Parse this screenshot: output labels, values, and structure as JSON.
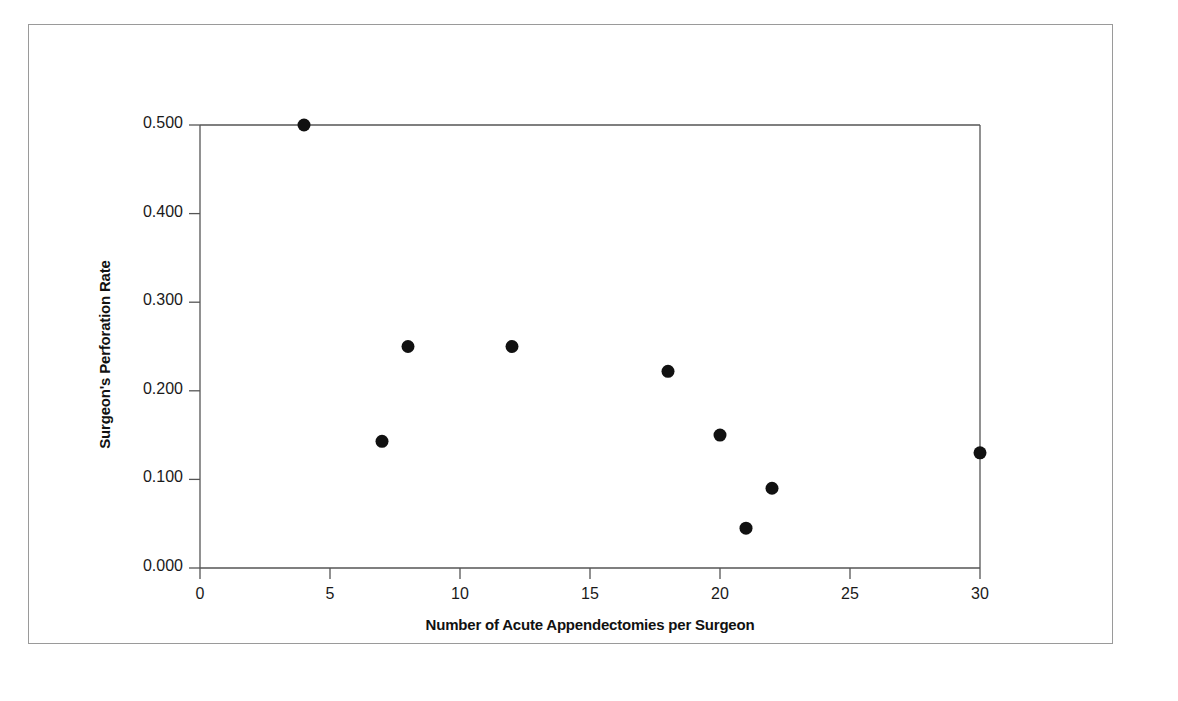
{
  "figure": {
    "background_color": "#ffffff",
    "frame_color": "#9a9a9a",
    "axis_color": "#555555",
    "marker_color": "#111111"
  },
  "chart_data": {
    "type": "scatter",
    "title": "",
    "xlabel": "Number of Acute Appendectomies per Surgeon",
    "ylabel": "Surgeon's Perforation Rate",
    "xlim": [
      0,
      30
    ],
    "ylim": [
      0.0,
      0.5
    ],
    "xticks": [
      0,
      5,
      10,
      15,
      20,
      25,
      30
    ],
    "xtick_labels": [
      "0",
      "5",
      "10",
      "15",
      "20",
      "25",
      "30"
    ],
    "yticks": [
      0.0,
      0.1,
      0.2,
      0.3,
      0.4,
      0.5
    ],
    "ytick_labels": [
      "0.000",
      "0.100",
      "0.200",
      "0.300",
      "0.400",
      "0.500"
    ],
    "grid": false,
    "legend": null,
    "marker": "filled-circle",
    "marker_size_px": 13,
    "points": [
      {
        "x": 4.0,
        "y": 0.5
      },
      {
        "x": 7.0,
        "y": 0.143
      },
      {
        "x": 8.0,
        "y": 0.25
      },
      {
        "x": 12.0,
        "y": 0.25
      },
      {
        "x": 18.0,
        "y": 0.222
      },
      {
        "x": 20.0,
        "y": 0.15
      },
      {
        "x": 21.0,
        "y": 0.045
      },
      {
        "x": 22.0,
        "y": 0.09
      },
      {
        "x": 30.0,
        "y": 0.13
      }
    ]
  }
}
